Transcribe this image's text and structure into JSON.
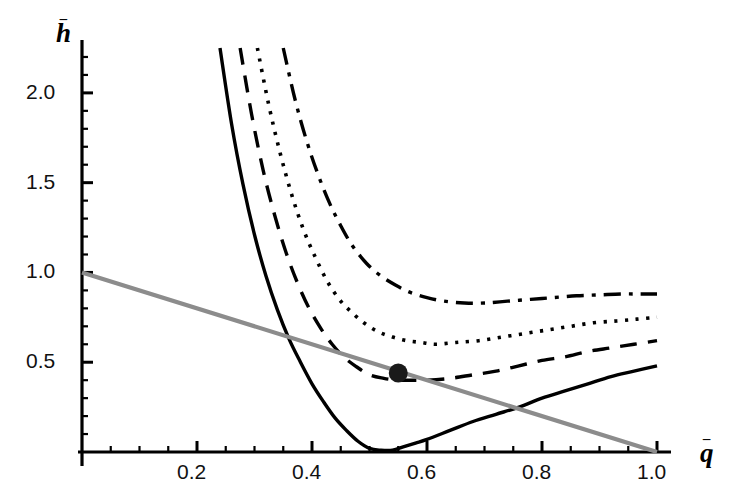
{
  "figure": {
    "background": "#ffffff",
    "axis_color": "#000000",
    "curve_color": "#000000",
    "line_color": "#8c8c8c",
    "marker_color": "#1a1a1a"
  },
  "labels": {
    "y_axis": "h",
    "y_axis_overbar": "–",
    "x_axis": "q",
    "x_axis_overbar": "–"
  },
  "chart_data": {
    "type": "line",
    "title": "",
    "xlabel": "q̄",
    "ylabel": "h̄",
    "xlim": [
      0,
      1.0
    ],
    "ylim": [
      0,
      2.25
    ],
    "grid": false,
    "legend": "none",
    "x_ticks_major": [
      0.2,
      0.4,
      0.6,
      0.8,
      1.0
    ],
    "x_tick_labels": [
      "0.2",
      "0.4",
      "0.6",
      "0.8",
      "1.0"
    ],
    "x_ticks_minor_step": 0.05,
    "y_ticks_major": [
      0.5,
      1.0,
      1.5,
      2.0
    ],
    "y_tick_labels": [
      "0.5",
      "1.0",
      "1.5",
      "2.0"
    ],
    "y_ticks_minor_step": 0.1,
    "series": [
      {
        "name": "curve-solid",
        "style": "solid",
        "color": "#000000",
        "width": 3.4,
        "x": [
          0.24,
          0.26,
          0.28,
          0.3,
          0.32,
          0.34,
          0.36,
          0.38,
          0.4,
          0.42,
          0.44,
          0.46,
          0.48,
          0.5,
          0.52,
          0.54,
          0.56,
          0.58,
          0.6,
          0.64,
          0.68,
          0.72,
          0.76,
          0.8,
          0.84,
          0.88,
          0.92,
          0.96,
          1.0
        ],
        "y": [
          2.25,
          1.83,
          1.49,
          1.21,
          0.98,
          0.79,
          0.63,
          0.5,
          0.38,
          0.28,
          0.19,
          0.12,
          0.06,
          0.02,
          0.01,
          0.01,
          0.03,
          0.05,
          0.07,
          0.12,
          0.17,
          0.21,
          0.25,
          0.3,
          0.34,
          0.38,
          0.42,
          0.45,
          0.48
        ]
      },
      {
        "name": "curve-dashed",
        "style": "dashed",
        "color": "#000000",
        "width": 3.4,
        "x": [
          0.275,
          0.295,
          0.315,
          0.335,
          0.355,
          0.375,
          0.395,
          0.415,
          0.435,
          0.455,
          0.475,
          0.5,
          0.525,
          0.55,
          0.575,
          0.6,
          0.64,
          0.68,
          0.72,
          0.76,
          0.8,
          0.84,
          0.88,
          0.92,
          0.96,
          1.0
        ],
        "y": [
          2.25,
          1.88,
          1.57,
          1.32,
          1.11,
          0.94,
          0.8,
          0.69,
          0.6,
          0.53,
          0.48,
          0.43,
          0.41,
          0.4,
          0.4,
          0.4,
          0.41,
          0.43,
          0.45,
          0.48,
          0.51,
          0.53,
          0.56,
          0.58,
          0.6,
          0.62
        ]
      },
      {
        "name": "curve-dotted",
        "style": "dotted",
        "color": "#000000",
        "width": 3.6,
        "x": [
          0.305,
          0.325,
          0.345,
          0.365,
          0.385,
          0.405,
          0.425,
          0.445,
          0.465,
          0.49,
          0.515,
          0.54,
          0.565,
          0.59,
          0.615,
          0.65,
          0.69,
          0.73,
          0.77,
          0.81,
          0.85,
          0.89,
          0.93,
          0.965,
          1.0
        ],
        "y": [
          2.25,
          1.93,
          1.66,
          1.43,
          1.24,
          1.09,
          0.96,
          0.86,
          0.79,
          0.72,
          0.67,
          0.64,
          0.62,
          0.61,
          0.6,
          0.61,
          0.62,
          0.64,
          0.66,
          0.68,
          0.7,
          0.72,
          0.73,
          0.74,
          0.75
        ]
      },
      {
        "name": "curve-dashdot",
        "style": "dashdot",
        "color": "#000000",
        "width": 3.4,
        "x": [
          0.35,
          0.37,
          0.39,
          0.41,
          0.43,
          0.45,
          0.47,
          0.495,
          0.52,
          0.545,
          0.57,
          0.6,
          0.63,
          0.665,
          0.7,
          0.74,
          0.78,
          0.82,
          0.86,
          0.9,
          0.94,
          0.97,
          1.0
        ],
        "y": [
          2.25,
          1.97,
          1.74,
          1.55,
          1.39,
          1.26,
          1.15,
          1.05,
          0.98,
          0.93,
          0.89,
          0.86,
          0.84,
          0.83,
          0.83,
          0.84,
          0.85,
          0.86,
          0.87,
          0.875,
          0.88,
          0.88,
          0.88
        ]
      },
      {
        "name": "budget-line",
        "style": "solid",
        "color": "#8c8c8c",
        "width": 4.2,
        "x": [
          0.0,
          1.0
        ],
        "y": [
          1.0,
          0.0
        ]
      }
    ],
    "markers": [
      {
        "name": "tangency-point",
        "x": 0.55,
        "y": 0.44,
        "color": "#1a1a1a",
        "size": 9.5,
        "shape": "circle"
      }
    ]
  }
}
